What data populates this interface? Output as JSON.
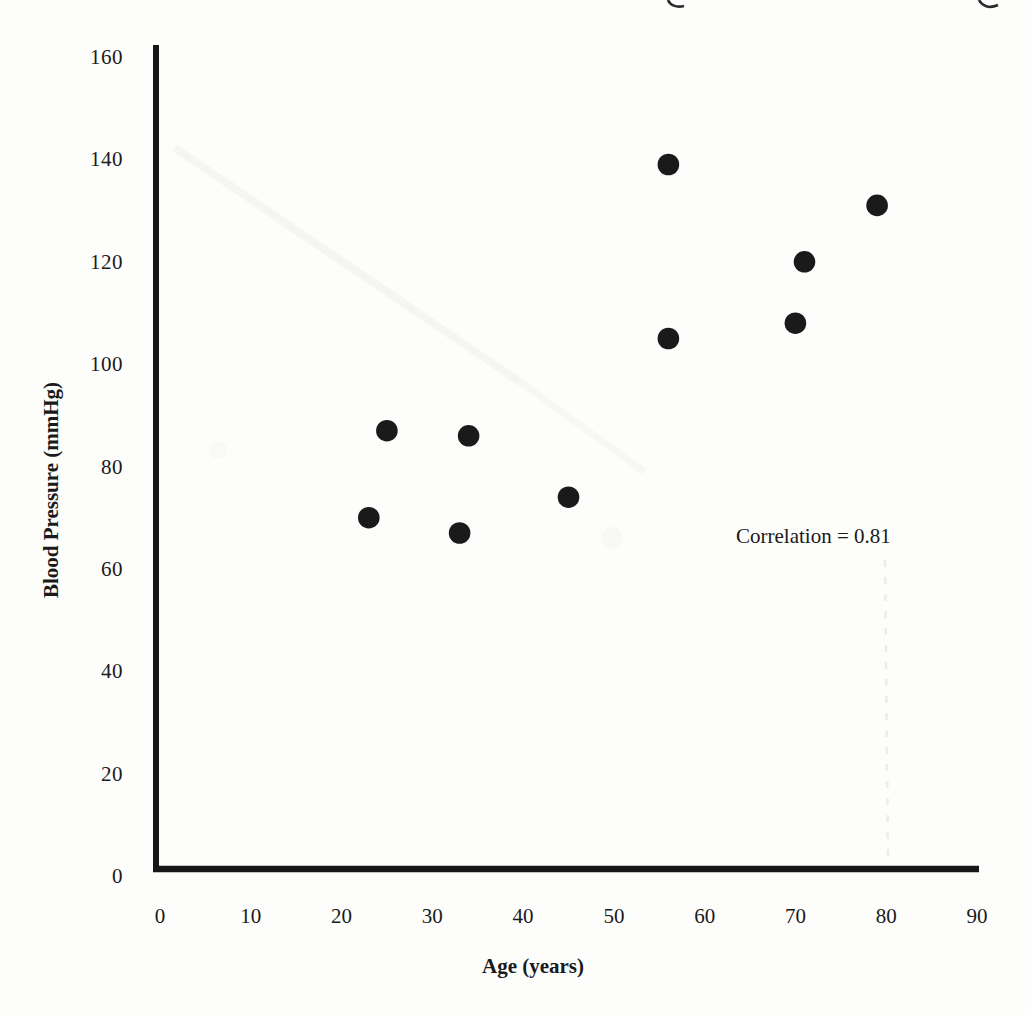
{
  "chart_data": {
    "type": "scatter",
    "xlabel": "Age (years)",
    "ylabel": "Blood Pressure (mmHg)",
    "annotation": "Correlation = 0.81",
    "x_ticks": [
      0,
      10,
      20,
      30,
      40,
      50,
      60,
      70,
      80,
      90
    ],
    "y_ticks": [
      0,
      20,
      40,
      60,
      80,
      100,
      120,
      140,
      160
    ],
    "xlim": [
      0,
      90
    ],
    "ylim": [
      0,
      160
    ],
    "grid": false,
    "legend": false,
    "marker": {
      "shape": "filled-circle",
      "color": "#1a1a1a"
    },
    "points": [
      {
        "x": 23,
        "y": 70
      },
      {
        "x": 25,
        "y": 87
      },
      {
        "x": 33,
        "y": 67
      },
      {
        "x": 34,
        "y": 86
      },
      {
        "x": 45,
        "y": 74
      },
      {
        "x": 56,
        "y": 105
      },
      {
        "x": 56,
        "y": 139
      },
      {
        "x": 70,
        "y": 108
      },
      {
        "x": 71,
        "y": 120
      },
      {
        "x": 79,
        "y": 131
      }
    ]
  },
  "colors": {
    "ink": "#1a1a1a",
    "axis": "#161616",
    "paper": "#fdfdfc"
  }
}
